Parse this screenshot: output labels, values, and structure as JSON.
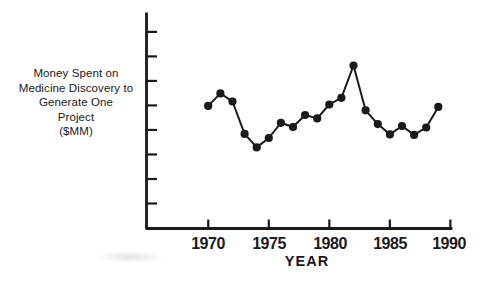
{
  "figure": {
    "background_color": "#ffffff",
    "ink_color": "#1a1a1a"
  },
  "chart_data": {
    "type": "line",
    "title": "",
    "xlabel": "YEAR",
    "ylabel": "Money Spent on Medicine Discovery to Generate One Project ($MM)",
    "ylabel_lines": [
      "Money Spent on",
      "Medicine Discovery to",
      "Generate One",
      "Project",
      "($MM)"
    ],
    "x": [
      1970,
      1971,
      1972,
      1973,
      1974,
      1975,
      1976,
      1977,
      1978,
      1979,
      1980,
      1981,
      1982,
      1983,
      1984,
      1985,
      1986,
      1987,
      1988,
      1989
    ],
    "values": [
      4.98,
      5.49,
      5.16,
      3.84,
      3.29,
      3.67,
      4.29,
      4.12,
      4.61,
      4.47,
      5.04,
      5.31,
      6.63,
      4.8,
      4.24,
      3.82,
      4.16,
      3.8,
      4.1,
      4.94
    ],
    "values_note": "Y axis has 8 tick marks but no numeric labels; values estimated in tick units (1 = lowest tick, 8 = highest tick)",
    "x_tick_labels": [
      "1970",
      "1975",
      "1980",
      "1985",
      "1990"
    ],
    "x_tick_years": [
      1970,
      1975,
      1980,
      1985,
      1990
    ],
    "y_tick_values": [
      1,
      2,
      3,
      4,
      5,
      6,
      7,
      8
    ],
    "y_tick_labels_visible": false,
    "xlim": [
      1964.9,
      1990.05
    ],
    "ylim": [
      -0.02,
      8.73
    ],
    "grid": false,
    "legend": null,
    "marker": "filled-circle",
    "line_color": "#1a1a1a"
  }
}
